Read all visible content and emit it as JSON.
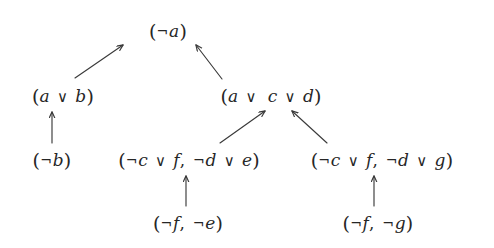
{
  "diagram": {
    "background_color": "#ffffff",
    "ink_color": "#262626",
    "arrow_color": "#3a3a3a",
    "nodes": [
      {
        "id": "n-not-a",
        "name": "node-not-a",
        "text": "(¬a)",
        "level": 0,
        "x": 168,
        "y": 30
      },
      {
        "id": "n-a-or-b",
        "name": "node-a-or-b",
        "text": "(a ∨ b)",
        "level": 1,
        "x": 63,
        "y": 95
      },
      {
        "id": "n-a-or-c-or-d",
        "name": "node-a-or-c-or-d",
        "text": "(a ∨  c ∨ d)",
        "level": 1,
        "x": 271,
        "y": 95
      },
      {
        "id": "n-not-b",
        "name": "node-not-b",
        "text": "(¬b)",
        "level": 2,
        "x": 52,
        "y": 159
      },
      {
        "id": "n-clause-e",
        "name": "node-clause-not-c-or-f-not-d-or-e",
        "text": "(¬c ∨ f, ¬d ∨ e)",
        "level": 2,
        "x": 189,
        "y": 159
      },
      {
        "id": "n-clause-g",
        "name": "node-clause-not-c-or-f-not-d-or-g",
        "text": "(¬c ∨ f, ¬d ∨ g)",
        "level": 2,
        "x": 382,
        "y": 159
      },
      {
        "id": "n-not-f-not-e",
        "name": "node-not-f-not-e",
        "text": "(¬f, ¬e)",
        "level": 3,
        "x": 188,
        "y": 222
      },
      {
        "id": "n-not-f-not-g",
        "name": "node-not-f-not-g",
        "text": "(¬f, ¬g)",
        "level": 3,
        "x": 378,
        "y": 222
      }
    ],
    "edges": [
      {
        "name": "arrow-a-or-b-to-not-a",
        "from": "n-a-or-b",
        "to": "n-not-a",
        "kind": "diagonal-up-right",
        "x1": 75,
        "y1": 78,
        "x2": 123,
        "y2": 45
      },
      {
        "name": "arrow-a-or-c-or-d-to-not-a",
        "from": "n-a-or-c-or-d",
        "to": "n-not-a",
        "kind": "diagonal-up-left",
        "x1": 222,
        "y1": 79,
        "x2": 196,
        "y2": 45
      },
      {
        "name": "arrow-not-b-to-a-or-b",
        "from": "n-not-b",
        "to": "n-a-or-b",
        "kind": "vertical-up",
        "x1": 52,
        "y1": 143,
        "x2": 52,
        "y2": 112
      },
      {
        "name": "arrow-clause-e-to-a-or-c-or-d",
        "from": "n-clause-e",
        "to": "n-a-or-c-or-d",
        "kind": "diagonal-up-right",
        "x1": 220,
        "y1": 143,
        "x2": 265,
        "y2": 111
      },
      {
        "name": "arrow-clause-g-to-a-or-c-or-d",
        "from": "n-clause-g",
        "to": "n-a-or-c-or-d",
        "kind": "diagonal-up-left",
        "x1": 327,
        "y1": 143,
        "x2": 292,
        "y2": 111
      },
      {
        "name": "arrow-not-f-not-e-to-clause-e",
        "from": "n-not-f-not-e",
        "to": "n-clause-e",
        "kind": "vertical-up",
        "x1": 186,
        "y1": 206,
        "x2": 186,
        "y2": 176
      },
      {
        "name": "arrow-not-f-not-g-to-clause-g",
        "from": "n-not-f-not-g",
        "to": "n-clause-g",
        "kind": "vertical-up",
        "x1": 374,
        "y1": 206,
        "x2": 374,
        "y2": 176
      }
    ]
  }
}
